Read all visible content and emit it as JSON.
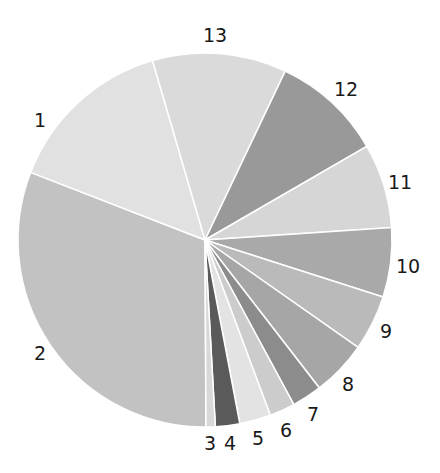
{
  "chart_data": {
    "type": "pie",
    "title": "",
    "start_angle_deg": 179.7,
    "direction": "clockwise",
    "center": [
      205,
      240
    ],
    "radius": 187,
    "categories": [
      "1",
      "2",
      "3",
      "4",
      "5",
      "6",
      "7",
      "8",
      "9",
      "10",
      "11",
      "12",
      "13"
    ],
    "values": [
      14.6,
      31.0,
      0.8,
      2.1,
      2.7,
      2.2,
      2.6,
      4.8,
      4.8,
      6.0,
      7.3,
      9.6,
      11.6
    ],
    "colors": [
      "#e1e1e1",
      "#c2c2c2",
      "#d8d8d8",
      "#5a5a5a",
      "#e3e3e3",
      "#cccccc",
      "#8c8c8c",
      "#a6a6a6",
      "#bababa",
      "#a9a9a9",
      "#d6d6d6",
      "#999999",
      "#dadada"
    ],
    "labels": [
      {
        "text": "1",
        "x": 40,
        "y": 127
      },
      {
        "text": "2",
        "x": 40,
        "y": 360
      },
      {
        "text": "3",
        "x": 210,
        "y": 450
      },
      {
        "text": "4",
        "x": 230,
        "y": 450
      },
      {
        "text": "5",
        "x": 258,
        "y": 445
      },
      {
        "text": "6",
        "x": 286,
        "y": 437
      },
      {
        "text": "7",
        "x": 313,
        "y": 421
      },
      {
        "text": "8",
        "x": 348,
        "y": 391
      },
      {
        "text": "9",
        "x": 386,
        "y": 338
      },
      {
        "text": "10",
        "x": 408,
        "y": 273
      },
      {
        "text": "11",
        "x": 400,
        "y": 189
      },
      {
        "text": "12",
        "x": 346,
        "y": 96
      },
      {
        "text": "13",
        "x": 215,
        "y": 42
      }
    ],
    "legend": null
  }
}
